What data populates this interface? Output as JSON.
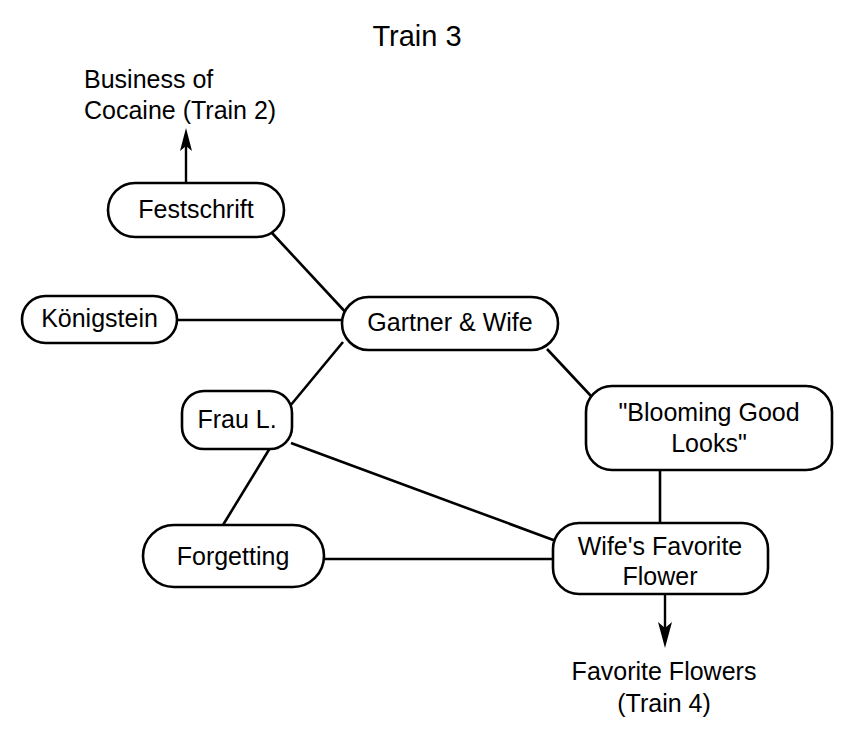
{
  "title": "Train 3",
  "nodes": [
    {
      "id": "festschrift",
      "label": "Festschrift",
      "lines": [
        "Festschrift"
      ]
    },
    {
      "id": "konigstein",
      "label": "Königstein",
      "lines": [
        "Königstein"
      ]
    },
    {
      "id": "gartner_wife",
      "label": "Gartner & Wife",
      "lines": [
        "Gartner & Wife"
      ]
    },
    {
      "id": "frau_l",
      "label": "Frau L.",
      "lines": [
        "Frau L."
      ]
    },
    {
      "id": "blooming_good_looks",
      "label": "\"Blooming Good Looks\"",
      "lines": [
        "\"Blooming Good",
        "Looks\""
      ]
    },
    {
      "id": "forgetting",
      "label": "Forgetting",
      "lines": [
        "Forgetting"
      ]
    },
    {
      "id": "wifes_favorite_flower",
      "label": "Wife's Favorite Flower",
      "lines": [
        "Wife's Favorite",
        "Flower"
      ]
    }
  ],
  "external_labels": [
    {
      "id": "business_of_cocaine",
      "lines": [
        "Business of",
        "Cocaine (Train 2)"
      ]
    },
    {
      "id": "favorite_flowers",
      "lines": [
        "Favorite Flowers",
        "(Train 4)"
      ]
    }
  ],
  "edges": [
    {
      "from": "festschrift",
      "to": "gartner_wife"
    },
    {
      "from": "konigstein",
      "to": "gartner_wife"
    },
    {
      "from": "gartner_wife",
      "to": "frau_l"
    },
    {
      "from": "gartner_wife",
      "to": "blooming_good_looks"
    },
    {
      "from": "frau_l",
      "to": "forgetting"
    },
    {
      "from": "frau_l",
      "to": "wifes_favorite_flower"
    },
    {
      "from": "forgetting",
      "to": "wifes_favorite_flower"
    },
    {
      "from": "blooming_good_looks",
      "to": "wifes_favorite_flower"
    }
  ],
  "arrows": [
    {
      "id": "arrow-to-business-of-cocaine",
      "from": "festschrift",
      "to": "business_of_cocaine",
      "direction": "up"
    },
    {
      "id": "arrow-to-favorite-flowers",
      "from": "wifes_favorite_flower",
      "to": "favorite_flowers",
      "direction": "down"
    }
  ],
  "colors": {
    "stroke": "#000000",
    "fill": "#ffffff",
    "background": "#ffffff"
  }
}
